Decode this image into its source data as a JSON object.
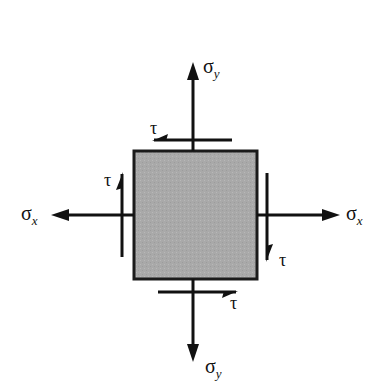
{
  "diagram": {
    "element": {
      "fill": "#a9a9a9",
      "stroke": "#1a1a1a"
    },
    "ink": "#111111",
    "labels": {
      "sigma_y_top": {
        "symbol": "σ",
        "subscript": "y"
      },
      "sigma_y_bottom": {
        "symbol": "σ",
        "subscript": "y"
      },
      "sigma_x_left": {
        "symbol": "σ",
        "subscript": "x"
      },
      "sigma_x_right": {
        "symbol": "σ",
        "subscript": "x"
      },
      "tau_top": "τ",
      "tau_left": "τ",
      "tau_right": "τ",
      "tau_bottom": "τ"
    }
  }
}
